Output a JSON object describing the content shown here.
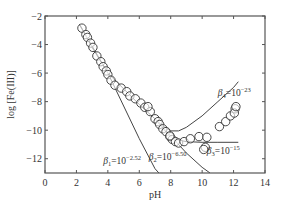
{
  "chart_data": {
    "type": "scatter",
    "title": "",
    "xlabel": "pH",
    "ylabel": "log [Fe(III)]",
    "xlim": [
      0,
      14
    ],
    "ylim": [
      -13,
      -2
    ],
    "xticks": [
      0,
      2,
      4,
      6,
      8,
      10,
      12,
      14
    ],
    "yticks": [
      -2,
      -4,
      -6,
      -8,
      -10,
      -12
    ],
    "xtick_labels": [
      "0",
      "2",
      "4",
      "6",
      "8",
      "10",
      "12",
      "14"
    ],
    "ytick_labels": [
      "−2",
      "−4",
      "−6",
      "−8",
      "−10",
      "−12"
    ],
    "grid": false,
    "legend": null,
    "series": [
      {
        "name": "measured",
        "kind": "scatter",
        "marker": "open-circle",
        "x": [
          2.35,
          2.6,
          2.7,
          2.9,
          3.05,
          3.3,
          3.55,
          3.7,
          3.9,
          4.0,
          4.2,
          4.45,
          4.85,
          5.2,
          5.4,
          5.75,
          6.1,
          6.35,
          6.7,
          6.55,
          7.0,
          7.2,
          7.3,
          7.5,
          7.7,
          7.95,
          8.1,
          8.3,
          7.95,
          8.5,
          8.85,
          9.25,
          9.8,
          10.3,
          10.2,
          10.1,
          11.1,
          11.5,
          11.8,
          12.1,
          12.05,
          12.15
        ],
        "y": [
          -2.85,
          -3.3,
          -3.5,
          -3.9,
          -4.2,
          -4.8,
          -5.2,
          -5.55,
          -5.85,
          -6.1,
          -6.5,
          -6.85,
          -7.05,
          -7.3,
          -7.6,
          -7.8,
          -8.1,
          -8.4,
          -8.7,
          -8.35,
          -9.2,
          -9.4,
          -9.6,
          -9.9,
          -10.1,
          -10.45,
          -10.65,
          -10.8,
          -10.4,
          -10.9,
          -10.8,
          -10.6,
          -10.45,
          -10.5,
          -11.2,
          -11.35,
          -9.75,
          -9.4,
          -9.0,
          -8.5,
          -8.8,
          -8.35
        ]
      },
      {
        "name": "β1 = 10^-2.52",
        "kind": "line",
        "x": [
          2.2,
          4.0,
          6.0,
          7.0,
          7.25
        ],
        "y": [
          -2.6,
          -6.0,
          -10.6,
          -12.7,
          -13.0
        ]
      },
      {
        "name": "β2 = 10^-6.50",
        "kind": "line",
        "x": [
          2.2,
          3.0,
          4.0,
          5.0,
          6.0,
          7.0,
          8.0,
          9.0,
          10.0,
          10.5
        ],
        "y": [
          -2.6,
          -4.2,
          -6.0,
          -7.1,
          -8.2,
          -9.2,
          -10.4,
          -11.6,
          -12.6,
          -13.0
        ]
      },
      {
        "name": "β3 = 10^-15",
        "kind": "line",
        "x": [
          7.0,
          7.5,
          8.0,
          8.5,
          9.0,
          10.0,
          11.0,
          12.3
        ],
        "y": [
          -9.2,
          -9.9,
          -10.5,
          -10.7,
          -10.8,
          -10.85,
          -10.85,
          -10.85
        ]
      },
      {
        "name": "β4 = 10^-23",
        "kind": "line",
        "x": [
          7.0,
          7.5,
          8.0,
          8.5,
          9.0,
          10.0,
          11.0,
          12.0,
          12.3
        ],
        "y": [
          -9.2,
          -9.7,
          -10.05,
          -10.05,
          -9.8,
          -9.0,
          -8.0,
          -7.0,
          -6.6
        ]
      }
    ],
    "annotations": [
      {
        "text": "β1 = 10⁻²·⁵²",
        "base": "β",
        "sub": "1",
        "eq": "=10",
        "exp": "−2.52",
        "x": 3.7,
        "y": -12.4
      },
      {
        "text": "β2 = 10⁻⁶·⁵⁰",
        "base": "β",
        "sub": "2",
        "eq": "=10",
        "exp": "−6.50",
        "x": 6.6,
        "y": -12.1
      },
      {
        "text": "β3 = 10⁻¹⁵",
        "base": "β",
        "sub": "3",
        "eq": "=10",
        "exp": "−15",
        "x": 10.3,
        "y": -11.7
      },
      {
        "text": "β4 = 10⁻²³",
        "base": "β",
        "sub": "4",
        "eq": "=10",
        "exp": "−23",
        "x": 11.0,
        "y": -7.6
      }
    ]
  },
  "colors": {
    "axis": "#555555",
    "line": "#444444",
    "marker_stroke": "#333333",
    "marker_fill": "#ffffff",
    "text": "#333333"
  }
}
